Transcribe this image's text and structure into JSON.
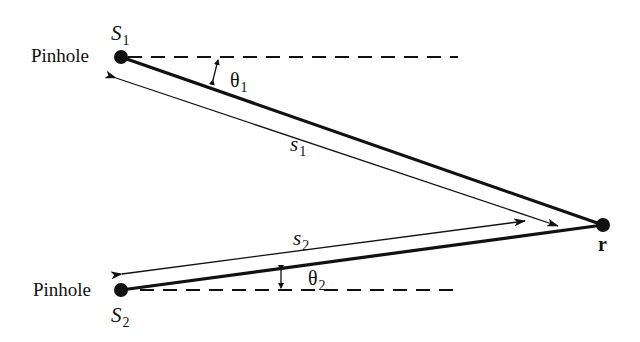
{
  "diagram": {
    "type": "two-pinhole interference geometry",
    "colors": {
      "ink": "#111111",
      "background": "#ffffff"
    },
    "labels": {
      "pinhole_top": "Pinhole",
      "pinhole_bottom": "Pinhole",
      "source_1": {
        "main": "S",
        "sub": "1"
      },
      "source_2": {
        "main": "S",
        "sub": "2"
      },
      "angle_1": {
        "main": "θ",
        "sub": "1"
      },
      "angle_2": {
        "main": "θ",
        "sub": "2"
      },
      "path_1": {
        "main": "s",
        "sub": "1"
      },
      "path_2": {
        "main": "s",
        "sub": "2"
      },
      "point_r": "r"
    },
    "points": {
      "S1": [
        121,
        57
      ],
      "S2": [
        121,
        290
      ],
      "r": [
        603,
        225
      ]
    }
  }
}
